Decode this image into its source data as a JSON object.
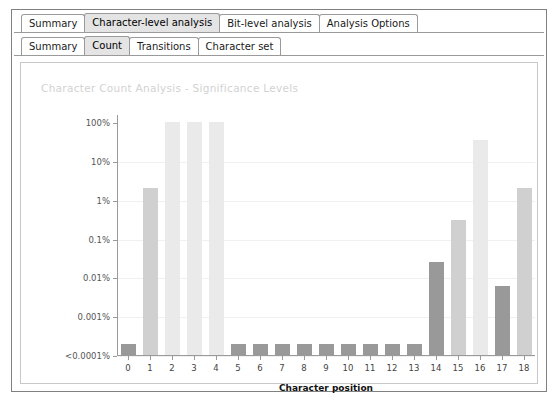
{
  "window": {
    "primary_tabs": [
      {
        "label": "Summary",
        "active": false
      },
      {
        "label": "Character-level analysis",
        "active": true
      },
      {
        "label": "Bit-level analysis",
        "active": false
      },
      {
        "label": "Analysis Options",
        "active": false
      }
    ],
    "secondary_tabs": [
      {
        "label": "Summary",
        "active": false
      },
      {
        "label": "Count",
        "active": true
      },
      {
        "label": "Transitions",
        "active": false
      },
      {
        "label": "Character set",
        "active": false
      }
    ]
  },
  "colors": {
    "bar_light": "#eaeaea",
    "bar_mid": "#d0d0d0",
    "bar_dark": "#999999",
    "grid": "#f0f0f0",
    "axis": "#9a9a9a",
    "title": "#d2d2d2",
    "tab_active_bg": "#e4e4e4"
  },
  "chart_data": {
    "type": "bar",
    "title": "Character Count Analysis - Significance Levels",
    "xlabel": "Character position",
    "ylabel": "",
    "yscale": "log",
    "grid": true,
    "legend": null,
    "ytick_labels": [
      "100%",
      "10%",
      "1%",
      "0.1%",
      "0.01%",
      "0.001%",
      "<0.0001%"
    ],
    "ytick_values": [
      100,
      10,
      1,
      0.1,
      0.01,
      0.001,
      0.0001
    ],
    "categories": [
      "0",
      "1",
      "2",
      "3",
      "4",
      "5",
      "6",
      "7",
      "8",
      "9",
      "10",
      "11",
      "12",
      "13",
      "14",
      "15",
      "16",
      "17",
      "18"
    ],
    "values": [
      0.0001,
      2.0,
      100,
      100,
      100,
      0.0001,
      0.0001,
      0.0001,
      0.0001,
      0.0001,
      0.0001,
      0.0001,
      0.0001,
      0.0001,
      0.025,
      0.3,
      35,
      0.006,
      2.0
    ],
    "bar_shades": [
      "dark",
      "mid",
      "light",
      "light",
      "light",
      "dark",
      "dark",
      "dark",
      "dark",
      "dark",
      "dark",
      "dark",
      "dark",
      "dark",
      "dark",
      "mid",
      "light",
      "dark",
      "mid"
    ]
  }
}
